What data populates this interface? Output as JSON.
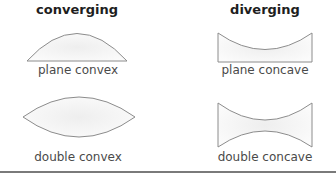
{
  "columns": {
    "converging": {
      "heading": "converging"
    },
    "diverging": {
      "heading": "diverging"
    }
  },
  "lenses": [
    {
      "name": "plane convex",
      "type": "converging",
      "label": "plane convex"
    },
    {
      "name": "plane concave",
      "type": "diverging",
      "label": "plane concave"
    },
    {
      "name": "double convex",
      "type": "converging",
      "label": "double convex"
    },
    {
      "name": "double concave",
      "type": "diverging",
      "label": "double concave"
    }
  ],
  "colors": {
    "outline": "#8c8c8c",
    "fill": "#f7f7f7",
    "rule": "#7a7a7a"
  }
}
